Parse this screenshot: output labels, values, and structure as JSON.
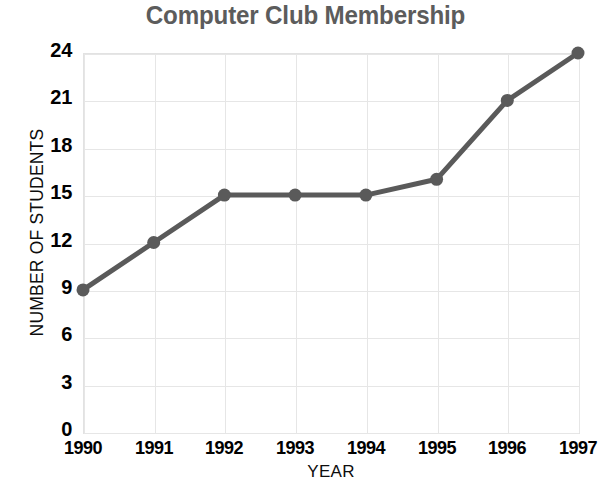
{
  "chart_data": {
    "type": "line",
    "title": "Computer Club Membership",
    "xlabel": "YEAR",
    "ylabel": "NUMBER OF STUDENTS",
    "categories": [
      "1990",
      "1991",
      "1992",
      "1993",
      "1994",
      "1995",
      "1996",
      "1997"
    ],
    "values": [
      9,
      12,
      15,
      15,
      15,
      16,
      21,
      24
    ],
    "x": [
      1990,
      1991,
      1992,
      1993,
      1994,
      1995,
      1996,
      1997
    ],
    "yticks": [
      0,
      3,
      6,
      9,
      12,
      15,
      18,
      21,
      24
    ],
    "ylim": [
      0,
      24
    ],
    "grid": true,
    "legend": false,
    "series": [
      {
        "name": "Members",
        "values": [
          9,
          12,
          15,
          15,
          15,
          16,
          21,
          24
        ]
      }
    ],
    "colors": {
      "line": "#5a5a5a",
      "marker": "#5a5a5a",
      "title": "#5c5c5c",
      "grid": "#e6e6e6",
      "axis_text": "#000000",
      "background": "#ffffff"
    }
  }
}
